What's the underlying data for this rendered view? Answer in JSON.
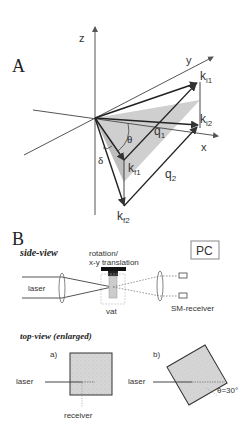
{
  "panel_a": {
    "label": "A",
    "axes": {
      "z": "z",
      "y": "y",
      "x": "x"
    },
    "vectors": {
      "ki1": "k",
      "ki1_sub": "i1",
      "ki2": "k",
      "ki2_sub": "i2",
      "kf1": "k",
      "kf1_sub": "f1",
      "kf2": "k",
      "kf2_sub": "f2",
      "q1": "q",
      "q1_sub": "1",
      "q2": "q",
      "q2_sub": "2"
    },
    "angles": {
      "theta": "θ",
      "delta": "δ"
    }
  },
  "panel_b": {
    "label": "B",
    "side_view": {
      "title": "side-view",
      "stage_label_line1": "rotation/",
      "stage_label_line2": "x-y translation",
      "laser": "laser",
      "vat": "vat",
      "receiver": "SM-receiver",
      "pc": "PC"
    },
    "top_view": {
      "title": "top-view (enlarged)",
      "a": {
        "label": "a)",
        "laser": "laser",
        "receiver": "receiver"
      },
      "b": {
        "label": "b)",
        "laser": "laser",
        "angle": "θ=30°"
      }
    }
  }
}
